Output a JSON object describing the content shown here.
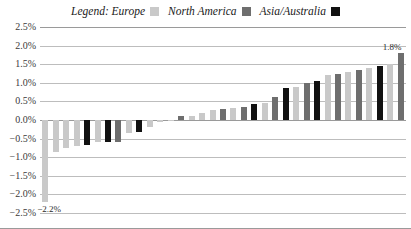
{
  "legend": {
    "prefix_label": "Legend: Europe",
    "entries": [
      {
        "label": "Legend: Europe",
        "series": "Europe",
        "color": "#c9c9c9"
      },
      {
        "label": "North America",
        "series": "North America",
        "color": "#6e6e6e"
      },
      {
        "label": "Asia/Australia",
        "series": "Asia/Australia",
        "color": "#111111"
      }
    ]
  },
  "axis": {
    "yticks": [
      "2.5%",
      "2.0%",
      "1.5%",
      "1.0%",
      "0.5%",
      "0.0%",
      "-0.5%",
      "-1.0%",
      "-1.5%",
      "-2.0%",
      "-2.5%"
    ]
  },
  "annotations": [
    {
      "name": "min-value-label",
      "text": "-2.2%"
    },
    {
      "name": "max-value-label",
      "text": "1.8%"
    }
  ],
  "chart_data": {
    "type": "bar",
    "title": "",
    "xlabel": "",
    "ylabel": "",
    "ylim": [
      -2.5,
      2.5
    ],
    "ytick_values": [
      2.5,
      2.0,
      1.5,
      1.0,
      0.5,
      0.0,
      -0.5,
      -1.0,
      -1.5,
      -2.0,
      -2.5
    ],
    "ytick_labels": [
      "2.5%",
      "2.0%",
      "1.5%",
      "1.0%",
      "0.5%",
      "0.0%",
      "-0.5%",
      "-1.0%",
      "-1.5%",
      "-2.0%",
      "-2.5%"
    ],
    "grid": true,
    "legend_position": "top-center",
    "categories": [
      "Europe",
      "North America",
      "Asia/Australia"
    ],
    "category_colors": {
      "Europe": "#c9c9c9",
      "North America": "#6e6e6e",
      "Asia/Australia": "#111111"
    },
    "bars": [
      {
        "value": -2.2,
        "group": "Europe"
      },
      {
        "value": -0.85,
        "group": "Europe"
      },
      {
        "value": -0.75,
        "group": "Europe"
      },
      {
        "value": -0.7,
        "group": "Europe"
      },
      {
        "value": -0.68,
        "group": "Asia/Australia"
      },
      {
        "value": -0.6,
        "group": "Europe"
      },
      {
        "value": -0.6,
        "group": "Asia/Australia"
      },
      {
        "value": -0.58,
        "group": "North America"
      },
      {
        "value": -0.35,
        "group": "Europe"
      },
      {
        "value": -0.33,
        "group": "Asia/Australia"
      },
      {
        "value": -0.18,
        "group": "Europe"
      },
      {
        "value": -0.05,
        "group": "Europe"
      },
      {
        "value": -0.03,
        "group": "Europe"
      },
      {
        "value": 0.1,
        "group": "North America"
      },
      {
        "value": 0.12,
        "group": "Europe"
      },
      {
        "value": 0.18,
        "group": "Europe"
      },
      {
        "value": 0.28,
        "group": "Europe"
      },
      {
        "value": 0.3,
        "group": "North America"
      },
      {
        "value": 0.32,
        "group": "Europe"
      },
      {
        "value": 0.35,
        "group": "North America"
      },
      {
        "value": 0.42,
        "group": "Asia/Australia"
      },
      {
        "value": 0.45,
        "group": "Europe"
      },
      {
        "value": 0.62,
        "group": "North America"
      },
      {
        "value": 0.85,
        "group": "Asia/Australia"
      },
      {
        "value": 0.9,
        "group": "Europe"
      },
      {
        "value": 1.0,
        "group": "North America"
      },
      {
        "value": 1.05,
        "group": "Asia/Australia"
      },
      {
        "value": 1.2,
        "group": "Europe"
      },
      {
        "value": 1.25,
        "group": "North America"
      },
      {
        "value": 1.3,
        "group": "Europe"
      },
      {
        "value": 1.35,
        "group": "North America"
      },
      {
        "value": 1.4,
        "group": "Europe"
      },
      {
        "value": 1.45,
        "group": "Asia/Australia"
      },
      {
        "value": 1.5,
        "group": "Europe"
      },
      {
        "value": 1.8,
        "group": "North America"
      }
    ],
    "annotated_points": [
      {
        "index": 0,
        "label": "-2.2%"
      },
      {
        "index": 34,
        "label": "1.8%"
      }
    ]
  }
}
